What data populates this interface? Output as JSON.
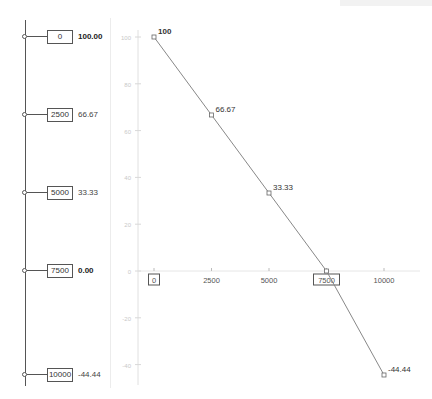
{
  "sliders": [
    {
      "input": "0",
      "output": "100.00",
      "emphasis": true
    },
    {
      "input": "2500",
      "output": "66.67",
      "emphasis": false
    },
    {
      "input": "5000",
      "output": "33.33",
      "emphasis": false
    },
    {
      "input": "7500",
      "output": "0.00",
      "emphasis": true
    },
    {
      "input": "10000",
      "output": "-44.44",
      "emphasis": false
    }
  ],
  "chart_data": {
    "type": "line",
    "title": "",
    "xlabel": "",
    "ylabel": "",
    "x": [
      0,
      2500,
      5000,
      7500,
      10000
    ],
    "series": [
      {
        "name": "value",
        "values": [
          100,
          66.67,
          33.33,
          0,
          -44.44
        ],
        "point_labels": [
          "100",
          "66.67",
          "33.33",
          "",
          "-44.44"
        ]
      }
    ],
    "x_ticks": [
      "0",
      "2500",
      "5000",
      "7500",
      "10000"
    ],
    "x_tick_boxed": [
      "0",
      "7500"
    ],
    "y_ticks": [
      "100",
      "80",
      "60",
      "40",
      "20",
      "0",
      "-20",
      "-40"
    ],
    "xlim": [
      0,
      10000
    ],
    "ylim": [
      -44.44,
      100
    ],
    "grid": false,
    "legend": "none",
    "line_color": "#888888"
  }
}
